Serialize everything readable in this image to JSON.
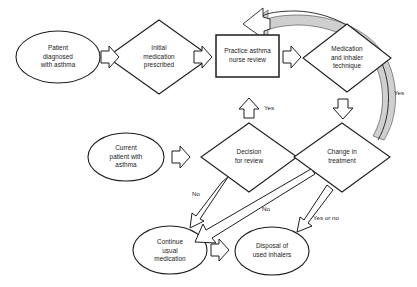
{
  "diagram": {
    "background_color": "#ffffff",
    "stroke_color": "#1d1d1d",
    "curved_arrow_fill": "#cfcfcf",
    "nodes": [
      {
        "id": "patient-diagnosed",
        "shape": "ellipse",
        "label": "Patient\ndiagnosed\nwith asthma"
      },
      {
        "id": "initial-medication",
        "shape": "diamond",
        "label": "Initial\nmedication\nprescribed"
      },
      {
        "id": "practice-asthma-nurse-review",
        "shape": "rectangle",
        "label": "Practice asthma\nnurse review"
      },
      {
        "id": "medication-inhaler-technique",
        "shape": "diamond",
        "label": "Medication\nand inhaler\ntechnique"
      },
      {
        "id": "current-patient",
        "shape": "ellipse",
        "label": "Current\npatient with\nasthma"
      },
      {
        "id": "decision-for-review",
        "shape": "diamond",
        "label": "Decision\nfor review"
      },
      {
        "id": "change-in-treatment",
        "shape": "diamond",
        "label": "Change in\ntreatment"
      },
      {
        "id": "continue-usual-medication",
        "shape": "ellipse",
        "label": "Continue\nusual\nmedication"
      },
      {
        "id": "disposal-used-inhalers",
        "shape": "ellipse",
        "label": "Disposal of\nused inhalers"
      }
    ],
    "edge_labels": [
      {
        "id": "yes-up-to-nurse-review",
        "text": "Yes"
      },
      {
        "id": "yes-curved-loop",
        "text": "Yes"
      },
      {
        "id": "no-decision-to-continue",
        "text": "No"
      },
      {
        "id": "no-change-to-continue",
        "text": "No"
      },
      {
        "id": "yes-or-no-change-to-disposal",
        "text": "Yes or no"
      }
    ]
  }
}
